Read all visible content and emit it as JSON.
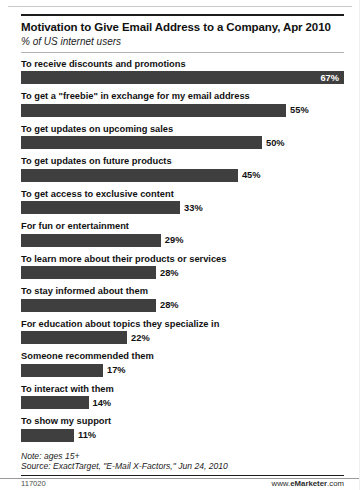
{
  "chart_data": {
    "type": "bar",
    "orientation": "horizontal",
    "title": "Motivation to Give Email Address to a Company, Apr 2010",
    "subtitle": "% of US internet users",
    "xlabel": "",
    "ylabel": "",
    "xlim": [
      0,
      67
    ],
    "grid": false,
    "legend": null,
    "categories": [
      "To receive discounts and promotions",
      "To get a \"freebie\" in exchange for my email address",
      "To get updates on upcoming sales",
      "To get updates on future products",
      "To get access to exclusive content",
      "For fun or entertainment",
      "To learn more about their products or services",
      "To stay informed about them",
      "For education about topics they specialize in",
      "Someone recommended them",
      "To interact with them",
      "To show my support"
    ],
    "values": [
      67,
      55,
      50,
      45,
      33,
      29,
      28,
      28,
      22,
      17,
      14,
      11
    ],
    "value_labels": [
      "67%",
      "55%",
      "50%",
      "45%",
      "33%",
      "29%",
      "28%",
      "28%",
      "22%",
      "17%",
      "14%",
      "11%"
    ],
    "bar_color": "#3f3f3f",
    "label_inside_first": true
  },
  "notes": {
    "note": "Note: ages 15+",
    "source": "Source: ExactTarget, \"E-Mail X-Factors,\" Jun 24, 2010"
  },
  "footer": {
    "id": "117020",
    "brand_prefix": "www.",
    "brand_name": "eMarketer",
    "brand_suffix": ".com"
  }
}
